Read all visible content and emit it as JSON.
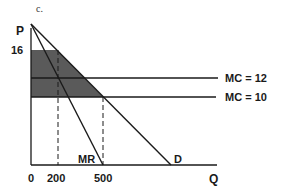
{
  "figure": {
    "caption": "c.",
    "axes": {
      "y_label": "P",
      "x_label": "Q",
      "origin": "0"
    },
    "y_ticks": [
      "16"
    ],
    "x_ticks": [
      "200",
      "500"
    ],
    "curves": {
      "mc_high": "MC = 12",
      "mc_low": "MC = 10",
      "mr": "MR",
      "demand": "D"
    },
    "shading_color": "#5a5a5a",
    "line_color": "#1a1a1a"
  }
}
